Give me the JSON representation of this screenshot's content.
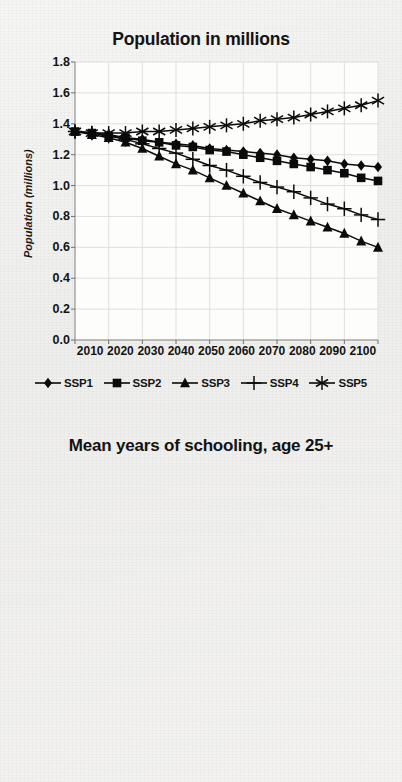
{
  "figure": {
    "background_color": "#f2f2f0",
    "ink_color": "#111111"
  },
  "legend": {
    "position": "below-chart-1",
    "items": [
      {
        "label": "SSP1",
        "marker": "diamond"
      },
      {
        "label": "SSP2",
        "marker": "square"
      },
      {
        "label": "SSP3",
        "marker": "triangle"
      },
      {
        "label": "SSP4",
        "marker": "plus"
      },
      {
        "label": "SSP5",
        "marker": "asterisk"
      }
    ]
  },
  "chart_data": [
    {
      "type": "line",
      "title": "Population in millions",
      "xlabel": "",
      "ylabel": "Population (millions)",
      "xlim": [
        2010,
        2100
      ],
      "ylim": [
        0.0,
        1.8
      ],
      "yticks": [
        "1.8",
        "1.6",
        "1.4",
        "1.2",
        "1.0",
        "0.8",
        "0.6",
        "0.4",
        "0.2",
        "0.0"
      ],
      "xticks": [
        "2010",
        "2020",
        "2030",
        "2040",
        "2050",
        "2060",
        "2070",
        "2080",
        "2090",
        "2100"
      ],
      "grid": true,
      "legend_position": "bottom",
      "x": [
        2010,
        2015,
        2020,
        2025,
        2030,
        2035,
        2040,
        2045,
        2050,
        2055,
        2060,
        2065,
        2070,
        2075,
        2080,
        2085,
        2090,
        2095,
        2100
      ],
      "series": [
        {
          "name": "SSP1",
          "marker": "diamond",
          "values": [
            1.35,
            1.34,
            1.33,
            1.31,
            1.3,
            1.28,
            1.27,
            1.26,
            1.24,
            1.23,
            1.22,
            1.21,
            1.2,
            1.18,
            1.17,
            1.16,
            1.14,
            1.13,
            1.12
          ]
        },
        {
          "name": "SSP2",
          "marker": "square",
          "values": [
            1.35,
            1.34,
            1.32,
            1.31,
            1.29,
            1.28,
            1.26,
            1.25,
            1.23,
            1.22,
            1.2,
            1.18,
            1.16,
            1.14,
            1.12,
            1.1,
            1.08,
            1.05,
            1.03
          ]
        },
        {
          "name": "SSP3",
          "marker": "triangle",
          "values": [
            1.35,
            1.33,
            1.31,
            1.28,
            1.24,
            1.19,
            1.14,
            1.1,
            1.05,
            1.0,
            0.95,
            0.9,
            0.85,
            0.81,
            0.77,
            0.73,
            0.69,
            0.64,
            0.6
          ]
        },
        {
          "name": "SSP4",
          "marker": "plus",
          "values": [
            1.35,
            1.34,
            1.32,
            1.3,
            1.27,
            1.24,
            1.21,
            1.17,
            1.13,
            1.1,
            1.06,
            1.02,
            0.99,
            0.96,
            0.92,
            0.88,
            0.85,
            0.81,
            0.78
          ]
        },
        {
          "name": "SSP5",
          "marker": "asterisk",
          "values": [
            1.35,
            1.34,
            1.34,
            1.34,
            1.35,
            1.35,
            1.36,
            1.37,
            1.38,
            1.39,
            1.4,
            1.42,
            1.43,
            1.44,
            1.46,
            1.48,
            1.5,
            1.52,
            1.55
          ]
        }
      ]
    },
    {
      "type": "line",
      "title": "Mean years of schooling, age 25+",
      "xlabel": "",
      "ylabel": "Mean years of schooling",
      "xlim": [
        2010,
        2100
      ],
      "ylim": [
        0.0,
        16.0
      ],
      "yticks": [
        "16.0",
        "14.0",
        "12.0",
        "10.0",
        "8.0",
        "6.0",
        "4.0",
        "2.0",
        "0.0"
      ],
      "xticks": [
        "2010",
        "2020",
        "2030",
        "2040",
        "2050",
        "2060",
        "2070",
        "2080",
        "2090",
        "2100"
      ],
      "grid": true,
      "legend_position": "none",
      "x": [
        2010,
        2015,
        2020,
        2025,
        2030,
        2035,
        2040,
        2045,
        2050,
        2055,
        2060,
        2065,
        2070,
        2075,
        2080,
        2085,
        2090,
        2095,
        2100
      ],
      "series": [
        {
          "name": "SSP1",
          "marker": "diamond",
          "values": [
            12.6,
            12.8,
            13.0,
            13.2,
            13.4,
            13.6,
            13.8,
            13.9,
            14.1,
            14.2,
            14.3,
            14.4,
            14.5,
            14.6,
            14.65,
            14.7,
            14.75,
            14.8,
            14.85
          ]
        },
        {
          "name": "SSP2",
          "marker": "square",
          "values": [
            12.6,
            12.75,
            12.9,
            13.05,
            13.2,
            13.35,
            13.5,
            13.6,
            13.7,
            13.8,
            13.9,
            14.0,
            14.1,
            14.15,
            14.2,
            14.25,
            14.3,
            14.35,
            14.4
          ]
        },
        {
          "name": "SSP3",
          "marker": "triangle",
          "values": [
            12.6,
            12.7,
            12.8,
            12.85,
            12.9,
            12.95,
            13.0,
            13.0,
            13.05,
            13.05,
            13.1,
            13.1,
            13.1,
            13.1,
            13.1,
            13.1,
            13.1,
            13.1,
            13.1
          ]
        },
        {
          "name": "SSP4",
          "marker": "plus",
          "values": [
            12.6,
            12.65,
            12.7,
            12.7,
            12.7,
            12.68,
            12.65,
            12.62,
            12.58,
            12.55,
            12.52,
            12.48,
            12.45,
            12.42,
            12.4,
            12.37,
            12.35,
            12.32,
            12.3
          ]
        },
        {
          "name": "SSP5",
          "marker": "asterisk",
          "values": [
            12.6,
            12.8,
            13.0,
            13.25,
            13.45,
            13.65,
            13.85,
            14.0,
            14.15,
            14.3,
            14.4,
            14.5,
            14.55,
            14.62,
            14.68,
            14.72,
            14.78,
            14.82,
            14.88
          ]
        }
      ]
    }
  ]
}
